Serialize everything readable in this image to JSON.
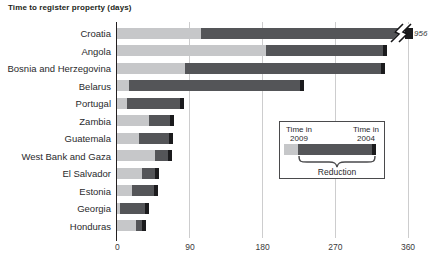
{
  "title": "Time to register property (days)",
  "legend": {
    "left": {
      "line1": "Time in",
      "line2": "2009"
    },
    "right": {
      "line1": "Time in",
      "line2": "2004"
    },
    "reduction_label": "Reduction"
  },
  "colors": {
    "bar_2009": "#c6c7c9",
    "bar_2004": "#545558",
    "bar_end_cap": "#1b1b1d",
    "axis_line": "#231f20",
    "gridline": "#cdcdce",
    "text": "#231f20"
  },
  "chart_data": {
    "type": "bar",
    "orientation": "horizontal",
    "title": "Time to register property (days)",
    "categories": [
      "Croatia",
      "Angola",
      "Bosnia and Herzegovina",
      "Belarus",
      "Portugal",
      "Zambia",
      "Guatemala",
      "West Bank and Gaza",
      "El Salvador",
      "Estonia",
      "Georgia",
      "Honduras"
    ],
    "series": [
      {
        "name": "Time in 2009",
        "values": [
          104,
          184,
          84,
          15,
          12,
          39,
          27,
          47,
          31,
          18,
          3,
          23
        ]
      },
      {
        "name": "Time in 2004",
        "values": [
          956,
          334,
          331,
          231,
          83,
          70,
          69,
          68,
          52,
          51,
          39,
          36
        ]
      }
    ],
    "xlim": [
      0,
      360
    ],
    "xticks": [
      0,
      90,
      180,
      270,
      360
    ],
    "grid": "vertical-gridlines-at-xticks",
    "legend_position": "inset-middle-right",
    "axis_break": {
      "category": "Croatia",
      "label": "956",
      "note": "bar broken at right edge, true value 956 days"
    }
  }
}
